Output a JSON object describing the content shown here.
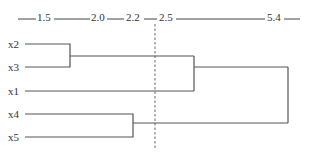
{
  "diagram": {
    "type": "dendrogram",
    "colors": {
      "line": "#555555",
      "text": "#333333",
      "background": "#ffffff"
    },
    "scale": {
      "ticks": [
        {
          "label": "1.5",
          "x": 37
        },
        {
          "label": "2.0",
          "x": 92
        },
        {
          "label": "2.2",
          "x": 127
        },
        {
          "label": "2.5",
          "x": 160
        },
        {
          "label": "5.4",
          "x": 268
        }
      ]
    },
    "cut_line": {
      "value": "2.2",
      "style": "dashed"
    },
    "leaves": [
      {
        "label": "x2"
      },
      {
        "label": "x3"
      },
      {
        "label": "x1"
      },
      {
        "label": "x4"
      },
      {
        "label": "x5"
      }
    ],
    "merges": [
      {
        "items": [
          "x2",
          "x3"
        ],
        "height": "1.5"
      },
      {
        "items": [
          "x4",
          "x5"
        ],
        "height": "2.0"
      },
      {
        "items": [
          "(x2,x3)",
          "x1"
        ],
        "height": "2.5"
      },
      {
        "items": [
          "(x2,x3,x1)",
          "(x4,x5)"
        ],
        "height": "5.4"
      }
    ]
  }
}
